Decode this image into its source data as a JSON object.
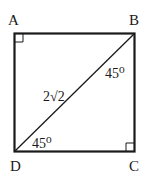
{
  "diagram": {
    "type": "geometry",
    "shape": "square",
    "vertices": {
      "A": "A",
      "B": "B",
      "C": "C",
      "D": "D"
    },
    "diagonal": {
      "from": "D",
      "to": "B",
      "length_label": "2√2"
    },
    "angles": {
      "at_B": "45⁰",
      "at_D": "45⁰"
    },
    "right_angle_markers": [
      "A",
      "C"
    ],
    "colors": {
      "stroke": "#1a1a1a",
      "background": "#ffffff"
    }
  }
}
